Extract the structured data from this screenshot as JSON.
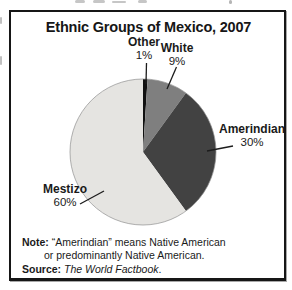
{
  "figure": {
    "title": "Ethnic Groups of Mexico, 2007"
  },
  "chart_data": {
    "type": "pie",
    "title": "Ethnic Groups of Mexico, 2007",
    "unit": "percent",
    "start_angle_deg": 0,
    "direction": "clockwise-from-12-oclock",
    "legend_position": "direct-labels-with-leader-lines",
    "slices": [
      {
        "label": "Other",
        "value": 1,
        "pct_label": "1%",
        "color": "#101010"
      },
      {
        "label": "White",
        "value": 9,
        "pct_label": "9%",
        "color": "#7f7f7f"
      },
      {
        "label": "Amerindian",
        "value": 30,
        "pct_label": "30%",
        "color": "#424242"
      },
      {
        "label": "Mestizo",
        "value": 60,
        "pct_label": "60%",
        "color": "#e5e4e1"
      }
    ]
  },
  "note": {
    "prefix": "Note:",
    "line1": "“Amerindian” means Native American",
    "line2": "or predominantly Native American."
  },
  "source": {
    "prefix": "Source:",
    "title": "The World Factbook",
    "suffix": "."
  }
}
